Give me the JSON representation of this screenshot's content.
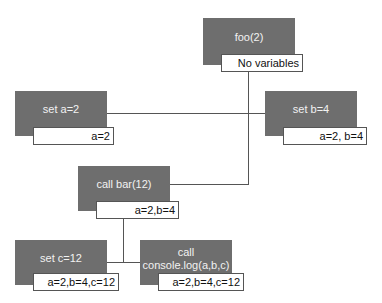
{
  "diagram": {
    "type": "call-tree",
    "nodes": [
      {
        "id": "foo",
        "label": "foo(2)",
        "variables": "No variables"
      },
      {
        "id": "set-a",
        "label": "set a=2",
        "variables": "a=2"
      },
      {
        "id": "set-b",
        "label": "set b=4",
        "variables": "a=2, b=4"
      },
      {
        "id": "call-bar",
        "label": "call bar(12)",
        "variables": "a=2,b=4"
      },
      {
        "id": "set-c",
        "label": "set c=12",
        "variables": "a=2,b=4,c=12"
      },
      {
        "id": "call-console",
        "label": "call console.log(a,b,c)",
        "label_line1": "call",
        "label_line2": "console.log(a,b,c)",
        "variables": "a=2,b=4,c=12"
      }
    ],
    "edges": [
      {
        "from": "foo",
        "to": "set-a"
      },
      {
        "from": "foo",
        "to": "set-b"
      },
      {
        "from": "foo",
        "to": "call-bar"
      },
      {
        "from": "call-bar",
        "to": "set-c"
      },
      {
        "from": "call-bar",
        "to": "call-console"
      }
    ],
    "colors": {
      "node_fill": "#6e6e6e",
      "node_text": "#f2f2f2",
      "line": "#555555",
      "vars_border": "#555555"
    }
  }
}
